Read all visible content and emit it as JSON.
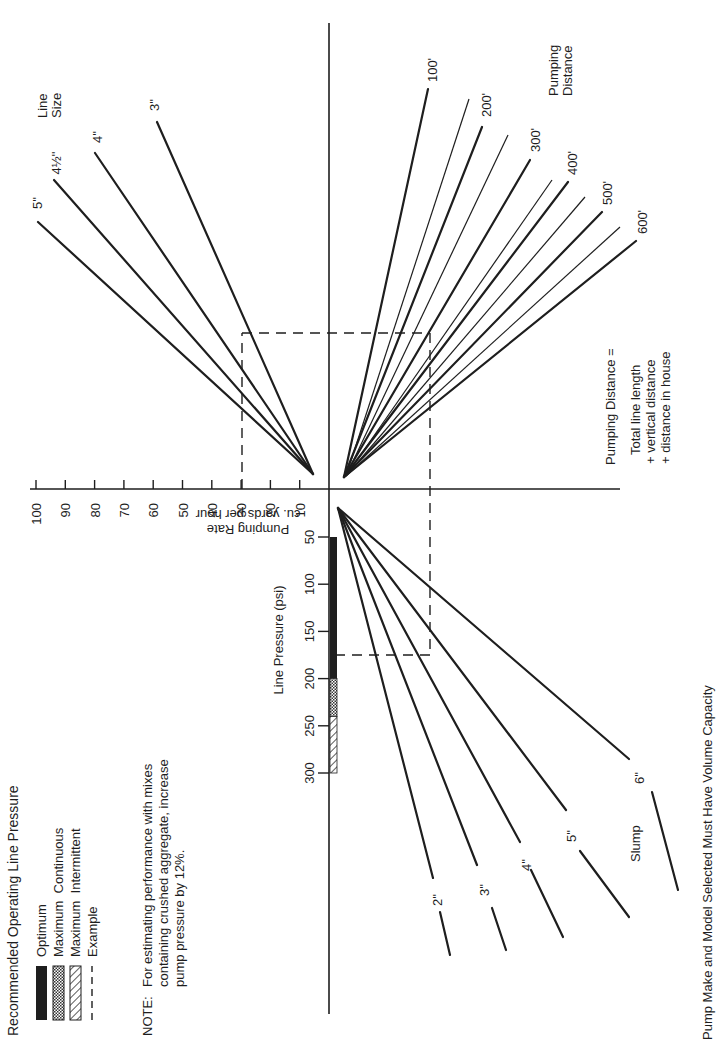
{
  "chart_data": {
    "type": "nomograph",
    "orientation": "rotated 90° counter-clockwise",
    "caption": "Pump Make and Model Selected Must Have Volume Capacity",
    "legend": {
      "title": "Recommended Operating Line Pressure",
      "entries": [
        {
          "label": "Optimum",
          "pattern": "solid"
        },
        {
          "label": "Maximum  Continuous",
          "pattern": "stipple"
        },
        {
          "label": "Maximum  Intermittent",
          "pattern": "hatch"
        },
        {
          "label": "Example",
          "pattern": "dashed"
        }
      ]
    },
    "note": {
      "prefix": "NOTE:",
      "lines": [
        "For estimating performance with mixes",
        "containing crushed aggregate, increase",
        "pump pressure by 12%."
      ]
    },
    "pumping_rate_axis": {
      "label_line1": "Pumping Rate",
      "label_line2": "cu. yards per hour",
      "ticks": [
        10,
        20,
        30,
        40,
        50,
        60,
        70,
        80,
        90,
        100
      ],
      "range": [
        0,
        100
      ]
    },
    "line_pressure_axis": {
      "label": "Line Pressure (psi)",
      "ticks": [
        50,
        100,
        150,
        200,
        250,
        300
      ],
      "range": [
        0,
        300
      ],
      "bands": [
        {
          "name": "Optimum",
          "from": 50,
          "to": 200
        },
        {
          "name": "Maximum Continuous",
          "from": 200,
          "to": 240
        },
        {
          "name": "Maximum Intermittent",
          "from": 240,
          "to": 300
        }
      ]
    },
    "line_size": {
      "title_line1": "Line",
      "title_line2": "Size",
      "lines": [
        "5''",
        "4½''",
        "4''",
        "3''"
      ]
    },
    "pumping_distance": {
      "title_line1": "Pumping",
      "title_line2": "Distance",
      "lines": [
        "100'",
        "200'",
        "300'",
        "400'",
        "500'",
        "600'"
      ],
      "definition": {
        "title": "Pumping Distance =",
        "lines": [
          "Total line length",
          "+ vertical distance",
          "+ distance in house"
        ]
      }
    },
    "slump": {
      "title": "Slump",
      "lines": [
        "2''",
        "3''",
        "4''",
        "5''",
        "6''"
      ]
    },
    "example": {
      "pumping_rate": 30,
      "line_pressure": 200,
      "line_size": "between 4'' and 5''",
      "pumping_distance": "about 450'",
      "slump": "between 4'' and 5''"
    }
  }
}
